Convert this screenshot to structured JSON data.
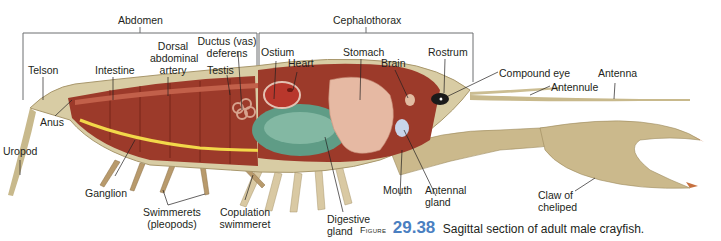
{
  "figure": {
    "word": "Figure",
    "number": "29.38",
    "title": "Sagittal section of adult male crayfish.",
    "number_color": "#4a7fc1"
  },
  "regions": {
    "abdomen": "Abdomen",
    "cephalothorax": "Cephalothorax"
  },
  "labels": {
    "telson": "Telson",
    "intestine": "Intestine",
    "dorsal_artery_1": "Dorsal",
    "dorsal_artery_2": "abdominal",
    "dorsal_artery_3": "artery",
    "ductus_1": "Ductus (vas)",
    "ductus_2": "deferens",
    "testis": "Testis",
    "ostium": "Ostium",
    "heart": "Heart",
    "stomach": "Stomach",
    "brain": "Brain",
    "rostrum": "Rostrum",
    "compound_eye": "Compound eye",
    "antenna": "Antenna",
    "antennule": "Antennule",
    "anus": "Anus",
    "uropod": "Uropod",
    "ganglion": "Ganglion",
    "swimmerets_1": "Swimmerets",
    "swimmerets_2": "(pleopods)",
    "copulation_1": "Copulation",
    "copulation_2": "swimmeret",
    "digestive_1": "Digestive",
    "digestive_2": "gland",
    "mouth": "Mouth",
    "antennal_gland_1": "Antennal",
    "antennal_gland_2": "gland",
    "claw_1": "Claw of",
    "claw_2": "cheliped"
  },
  "colors": {
    "body_outline": "#c9b48a",
    "muscle": "#9c3a2a",
    "muscle_dark": "#7a2418",
    "nerve_cord": "#f2d84a",
    "digestive_gland": "#5f9c86",
    "stomach": "#e6b9a3",
    "heart": "#b8372c",
    "shell": "#d8cfae",
    "leader_line": "#231f20"
  }
}
